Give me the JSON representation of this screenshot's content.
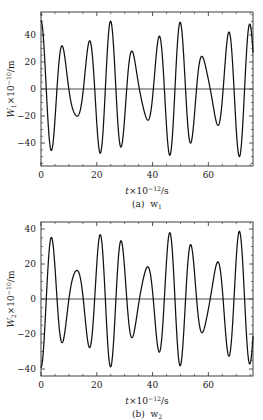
{
  "figure": {
    "panels": [
      {
        "id": "panel-a",
        "caption_prefix": "(a)",
        "caption_symbol": "w",
        "caption_sub": "1",
        "yaxis": {
          "symbol": "W",
          "sub": "1",
          "times": "×10",
          "exp": "−10",
          "unit": "/m",
          "ticks": [
            -40,
            -20,
            0,
            20,
            40
          ],
          "ticklabels": [
            "−40",
            "−20",
            "0",
            "20",
            "40"
          ],
          "lim": [
            -57,
            57
          ]
        },
        "xaxis": {
          "symbol": "t",
          "times": "×10",
          "exp": "−12",
          "unit": "/s",
          "ticks": [
            0,
            20,
            40,
            60
          ],
          "ticklabels": [
            "0",
            "20",
            "40",
            "60"
          ],
          "lim": [
            0,
            76
          ]
        }
      },
      {
        "id": "panel-b",
        "caption_prefix": "(b)",
        "caption_symbol": "w",
        "caption_sub": "2",
        "yaxis": {
          "symbol": "W",
          "sub": "2",
          "times": "×10",
          "exp": "−10",
          "unit": "/m",
          "ticks": [
            -40,
            -20,
            0,
            20,
            40
          ],
          "ticklabels": [
            "−40",
            "−20",
            "0",
            "20",
            "40"
          ],
          "lim": [
            -44,
            44
          ]
        },
        "xaxis": {
          "symbol": "t",
          "times": "×10",
          "exp": "−12",
          "unit": "/s",
          "ticks": [
            0,
            20,
            40,
            60
          ],
          "ticklabels": [
            "0",
            "20",
            "40",
            "60"
          ],
          "lim": [
            0,
            76
          ]
        }
      }
    ]
  },
  "chart_data": [
    {
      "type": "line",
      "title": "(a) w1",
      "xlabel": "t×10⁻¹²/s",
      "ylabel": "W1×10⁻¹⁰/m",
      "xlim": [
        0,
        76
      ],
      "ylim": [
        -57,
        57
      ],
      "xticks": [
        0,
        20,
        40,
        60
      ],
      "yticks": [
        -40,
        -20,
        0,
        20,
        40
      ],
      "grid": false,
      "legend": null,
      "series": [
        {
          "name": "W1",
          "model": "beat",
          "amp1": 35.0,
          "amp2": 15.5,
          "period1": 8.35,
          "period2": 6.2,
          "phase1_deg": 0,
          "phase2_deg": 0,
          "offset": 0,
          "notes": "two cosines summed; envelope beats with ~25 unit period",
          "annotated_extrema": {
            "tall_peaks_t": [
              0,
              25.2,
              50.4,
              75.5
            ],
            "tall_peaks_y": [
              50,
              50,
              50,
              50
            ],
            "small_peaks_t": [
              8.4,
              16.8,
              33.6,
              42.0,
              58.8,
              67.2
            ],
            "small_peaks_y": [
              20,
              20,
              20,
              20,
              21,
              21
            ],
            "deep_troughs_t": [
              12.6,
              37.8,
              63.0
            ],
            "deep_troughs_y": [
              -51,
              -51,
              -51
            ],
            "shallow_troughs_t": [
              4.3,
              21.0,
              29.4,
              46.0,
              54.5,
              71.0
            ],
            "shallow_troughs_y": [
              -21,
              -21,
              -22,
              -21,
              -21,
              -20
            ]
          }
        }
      ]
    },
    {
      "type": "line",
      "title": "(b) w2",
      "xlabel": "t×10⁻¹²/s",
      "ylabel": "W2×10⁻¹⁰/m",
      "xlim": [
        0,
        76
      ],
      "ylim": [
        -44,
        44
      ],
      "xticks": [
        0,
        20,
        40,
        60
      ],
      "yticks": [
        -40,
        -20,
        0,
        20,
        40
      ],
      "grid": false,
      "legend": null,
      "series": [
        {
          "name": "W2",
          "model": "beat",
          "amp1": 27.5,
          "amp2": 11.5,
          "period1": 8.35,
          "period2": 6.2,
          "phase1_deg": 180,
          "phase2_deg": 180,
          "offset": 0,
          "notes": "inverted beat relative to panel (a); starts near -39",
          "annotated_extrema": {
            "tall_peaks_t": [
              12.4,
              37.6,
              62.8
            ],
            "tall_peaks_y": [
              39,
              39,
              39
            ],
            "small_peaks_t": [
              4.2,
              20.8,
              29.2,
              45.8,
              54.3,
              70.6
            ],
            "small_peaks_y": [
              16,
              15,
              16,
              16,
              16,
              16
            ],
            "deep_troughs_t": [
              0,
              25.0,
              50.2,
              75.4
            ],
            "deep_troughs_y": [
              -39,
              -39,
              -39,
              -39
            ],
            "shallow_troughs_t": [
              8.3,
              16.7,
              33.4,
              41.8,
              58.6,
              67.0
            ],
            "shallow_troughs_y": [
              -15,
              -15,
              -15,
              -15,
              -15,
              -15
            ]
          }
        }
      ]
    }
  ]
}
